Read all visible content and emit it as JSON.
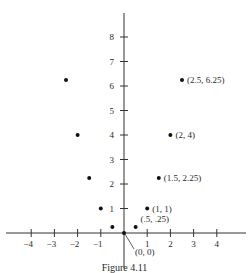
{
  "chart_data": {
    "type": "scatter",
    "title": "",
    "caption": "Figure 4.11",
    "function": "y = x^2",
    "xlabel": "",
    "ylabel": "",
    "xlim": [
      -4.5,
      5
    ],
    "ylim": [
      -1,
      9.5
    ],
    "grid": false,
    "x_ticks": [
      -4,
      -3,
      -2,
      -1,
      1,
      2,
      3,
      4
    ],
    "y_ticks": [
      1,
      2,
      3,
      4,
      5,
      6,
      7,
      8
    ],
    "points": [
      {
        "x": -2.5,
        "y": 6.25,
        "label": ""
      },
      {
        "x": -2,
        "y": 4,
        "label": ""
      },
      {
        "x": -1.5,
        "y": 2.25,
        "label": ""
      },
      {
        "x": -1,
        "y": 1,
        "label": ""
      },
      {
        "x": -0.5,
        "y": 0.25,
        "label": ""
      },
      {
        "x": 0,
        "y": 0,
        "label": "(0, 0)"
      },
      {
        "x": 0.5,
        "y": 0.25,
        "label": "(.5, .25)"
      },
      {
        "x": 1,
        "y": 1,
        "label": "(1, 1)"
      },
      {
        "x": 1.5,
        "y": 2.25,
        "label": "(1.5, 2.25)"
      },
      {
        "x": 2,
        "y": 4,
        "label": "(2, 4)"
      },
      {
        "x": 2.5,
        "y": 6.25,
        "label": "(2.5, 6.25)"
      }
    ]
  },
  "figure": {
    "caption": "Figure 4.11"
  }
}
